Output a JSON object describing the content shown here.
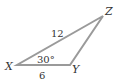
{
  "diagram": {
    "type": "triangle",
    "stroke_color": "#9a9a9a",
    "text_color": "#333333",
    "vertices": [
      {
        "label": "X",
        "x": 17,
        "y": 65
      },
      {
        "label": "Y",
        "x": 70,
        "y": 65
      },
      {
        "label": "Z",
        "x": 103,
        "y": 16
      }
    ],
    "sides": {
      "XZ": "12",
      "XY": "6"
    },
    "angle_X": "30°"
  }
}
